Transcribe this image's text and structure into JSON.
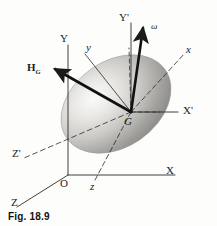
{
  "figure": {
    "caption": "Fig. 18.9",
    "background_color": "#fdfdfc",
    "line_color": "#2b2b2b",
    "body_color_light": "#f0efed",
    "body_color_dark": "#8e8d8b"
  },
  "labels": {
    "fixed_axis_x": "X",
    "fixed_axis_y": "Y",
    "fixed_axis_z": "Z",
    "origin": "O",
    "centroid": "G",
    "primed_axis_x": "X'",
    "primed_axis_y": "Y'",
    "primed_axis_z": "Z'",
    "body_axis_x": "x",
    "body_axis_y": "y",
    "body_axis_z": "z",
    "angular_momentum": "H",
    "angular_momentum_subscript": "G",
    "angular_velocity": "ω"
  },
  "vectors": [
    {
      "name": "angular-momentum",
      "label": "H_G",
      "style": "solid-bold-arrow",
      "direction": "upper-left"
    },
    {
      "name": "angular-velocity",
      "label": "ω",
      "style": "solid-bold-arrow",
      "direction": "upper-right"
    }
  ],
  "axes": [
    {
      "name": "fixed-frame",
      "labels": [
        "X",
        "Y",
        "Z"
      ],
      "origin": "O",
      "style": "solid"
    },
    {
      "name": "translating-frame",
      "labels": [
        "X'",
        "Y'",
        "Z'"
      ],
      "origin": "G",
      "style": "dashed-and-solid"
    },
    {
      "name": "body-frame",
      "labels": [
        "x",
        "y",
        "z"
      ],
      "origin": "G",
      "style": "thin-solid"
    }
  ]
}
